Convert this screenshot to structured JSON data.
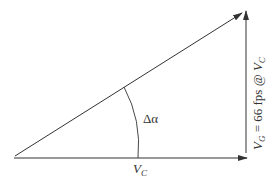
{
  "diagram": {
    "type": "velocity-vector-triangle",
    "colors": {
      "line": "#333333",
      "background": "#ffffff"
    },
    "vectors": [
      {
        "id": "horizontal",
        "label": "V_C"
      },
      {
        "id": "vertical",
        "label": "V_G = 66 fps @ V_C"
      },
      {
        "id": "resultant",
        "label": ""
      }
    ],
    "labels": {
      "angle": "Δα",
      "base_main": "V",
      "base_sub": "C",
      "vertical_v1": "V",
      "vertical_sub1": "G",
      "vertical_mid": " = 66 fps @ ",
      "vertical_v2": "V",
      "vertical_sub2": "C"
    }
  }
}
